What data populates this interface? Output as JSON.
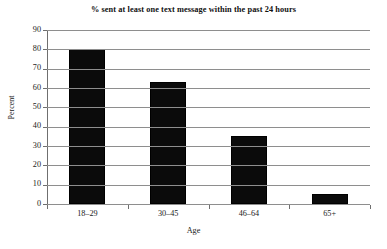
{
  "chart_data": {
    "type": "bar",
    "title": "% sent at least one text message within the past 24 hours",
    "xlabel": "Age",
    "ylabel": "Percent",
    "categories": [
      "18–29",
      "30–45",
      "46–64",
      "65+"
    ],
    "values": [
      80,
      63,
      35,
      5
    ],
    "ylim": [
      0,
      90
    ],
    "ytick_step": 10,
    "yticks": [
      "90",
      "80",
      "70",
      "60",
      "50",
      "40",
      "30",
      "20",
      "10",
      "0"
    ],
    "grid": "horizontal",
    "legend": "none",
    "bar_color": "#0b0b0b",
    "grid_color": "#8e8e8e",
    "axis_color": "#6f6f6f",
    "background": "#ffffff",
    "text_color": "#222222"
  }
}
